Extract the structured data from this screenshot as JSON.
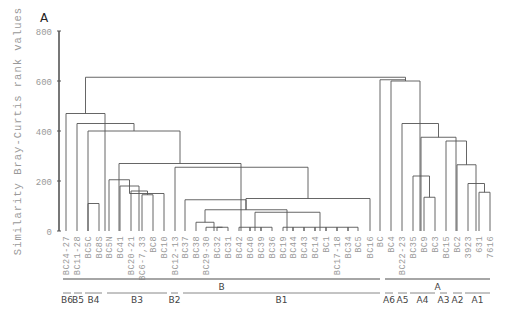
{
  "chart_data": {
    "type": "dendrogram",
    "panel_label": "A",
    "title": "",
    "ylabel": "Similarity Bray-Curtis rank values",
    "xlabel": "",
    "ylim": [
      0,
      800
    ],
    "yticks": [
      0,
      200,
      400,
      600,
      800
    ],
    "grid": false,
    "leaves": [
      {
        "label": "BC24-27",
        "x": 66
      },
      {
        "label": "BC11-28",
        "x": 77
      },
      {
        "label": "BC5C",
        "x": 88
      },
      {
        "label": "BC8S",
        "x": 99
      },
      {
        "label": "BC5N",
        "x": 109
      },
      {
        "label": "BC41",
        "x": 120
      },
      {
        "label": "BC20-21",
        "x": 131
      },
      {
        "label": "BC6-7,33",
        "x": 142
      },
      {
        "label": "BC8",
        "x": 153
      },
      {
        "label": "BC10",
        "x": 164
      },
      {
        "label": "BC12-13",
        "x": 175
      },
      {
        "label": "BC37",
        "x": 185
      },
      {
        "label": "BC38",
        "x": 196
      },
      {
        "label": "BC29-30",
        "x": 206
      },
      {
        "label": "BC32",
        "x": 217
      },
      {
        "label": "BC31",
        "x": 228
      },
      {
        "label": "BC42",
        "x": 239
      },
      {
        "label": "BC40",
        "x": 250
      },
      {
        "label": "BC39",
        "x": 261
      },
      {
        "label": "BC36",
        "x": 272
      },
      {
        "label": "BC19",
        "x": 283
      },
      {
        "label": "BC44",
        "x": 293
      },
      {
        "label": "BC43",
        "x": 304
      },
      {
        "label": "BC14",
        "x": 315
      },
      {
        "label": "BC1",
        "x": 326
      },
      {
        "label": "BC17-18",
        "x": 337
      },
      {
        "label": "BC34",
        "x": 348
      },
      {
        "label": "BC5",
        "x": 358
      },
      {
        "label": "BC16",
        "x": 370
      },
      {
        "label": "BC",
        "x": 380
      },
      {
        "label": "BC4",
        "x": 391
      },
      {
        "label": "BC22-23",
        "x": 402
      },
      {
        "label": "BC35",
        "x": 413
      },
      {
        "label": "BC9",
        "x": 424
      },
      {
        "label": "BC3",
        "x": 435
      },
      {
        "label": "BC15",
        "x": 446
      },
      {
        "label": "BC2",
        "x": 457
      },
      {
        "label": "3923",
        "x": 468
      },
      {
        "label": "631",
        "x": 479
      },
      {
        "label": "7616",
        "x": 490
      }
    ],
    "merges": [
      {
        "x1": 88,
        "x2": 99,
        "h": 110
      },
      {
        "x1": 142,
        "x2": 153,
        "h": 145
      },
      {
        "x1": 131,
        "x2": 147.5,
        "h": 160
      },
      {
        "x1": 120,
        "x2": 139,
        "h": 180
      },
      {
        "x1": 164,
        "x2": 129.5,
        "h": 150
      },
      {
        "x1": 109,
        "x2": 129.5,
        "h": 205
      },
      {
        "x1": 217,
        "x2": 228,
        "h": 15
      },
      {
        "x1": 206,
        "x2": 222.5,
        "h": 15
      },
      {
        "x1": 196,
        "x2": 214,
        "h": 35
      },
      {
        "x1": 239,
        "x2": 250,
        "h": 15
      },
      {
        "x1": 250,
        "x2": 261,
        "h": 15
      },
      {
        "x1": 261,
        "x2": 272,
        "h": 15
      },
      {
        "x1": 283,
        "x2": 293,
        "h": 15
      },
      {
        "x1": 293,
        "x2": 304,
        "h": 15
      },
      {
        "x1": 304,
        "x2": 315,
        "h": 15
      },
      {
        "x1": 315,
        "x2": 326,
        "h": 15
      },
      {
        "x1": 326,
        "x2": 337,
        "h": 15
      },
      {
        "x1": 337,
        "x2": 348,
        "h": 15
      },
      {
        "x1": 348,
        "x2": 358,
        "h": 15
      },
      {
        "x1": 255,
        "x2": 320,
        "h": 75
      },
      {
        "x1": 205,
        "x2": 287,
        "h": 85
      },
      {
        "x1": 185,
        "x2": 246,
        "h": 125
      },
      {
        "x1": 246,
        "x2": 370,
        "h": 130
      },
      {
        "x1": 175,
        "x2": 308,
        "h": 255
      },
      {
        "x1": 119,
        "x2": 241,
        "h": 270
      },
      {
        "x1": 88,
        "x2": 180,
        "h": 400
      },
      {
        "x1": 77,
        "x2": 134,
        "h": 430
      },
      {
        "x1": 66,
        "x2": 105,
        "h": 470
      },
      {
        "x1": 424,
        "x2": 435,
        "h": 135
      },
      {
        "x1": 413,
        "x2": 429.5,
        "h": 220
      },
      {
        "x1": 479,
        "x2": 490,
        "h": 155
      },
      {
        "x1": 468,
        "x2": 484.5,
        "h": 190
      },
      {
        "x1": 457,
        "x2": 476,
        "h": 265
      },
      {
        "x1": 446,
        "x2": 466.5,
        "h": 360
      },
      {
        "x1": 421,
        "x2": 456,
        "h": 375
      },
      {
        "x1": 402,
        "x2": 438.5,
        "h": 430
      },
      {
        "x1": 391,
        "x2": 420,
        "h": 600
      },
      {
        "x1": 85.5,
        "x2": 405.5,
        "h": 615
      }
    ],
    "groups": {
      "major": [
        {
          "label": "B",
          "x1": 63,
          "x2": 380
        },
        {
          "label": "A",
          "x1": 385,
          "x2": 490
        }
      ],
      "sub": [
        {
          "label": "B6",
          "x1": 63,
          "x2": 71
        },
        {
          "label": "B5",
          "x1": 74,
          "x2": 82
        },
        {
          "label": "B4",
          "x1": 85,
          "x2": 102
        },
        {
          "label": "B3",
          "x1": 107,
          "x2": 167
        },
        {
          "label": "B2",
          "x1": 171,
          "x2": 178
        },
        {
          "label": "B1",
          "x1": 183,
          "x2": 380
        },
        {
          "label": "A6",
          "x1": 385,
          "x2": 393
        },
        {
          "label": "A5",
          "x1": 398,
          "x2": 407
        },
        {
          "label": "A4",
          "x1": 410,
          "x2": 435
        },
        {
          "label": "A3",
          "x1": 440,
          "x2": 447
        },
        {
          "label": "A2",
          "x1": 453,
          "x2": 462
        },
        {
          "label": "A1",
          "x1": 465,
          "x2": 490
        }
      ]
    }
  },
  "colors": {
    "tree_line": "#555555",
    "axis": "#555555",
    "label_text": "#9a9a9a",
    "group_line": "#888888",
    "group_text": "#444444"
  }
}
